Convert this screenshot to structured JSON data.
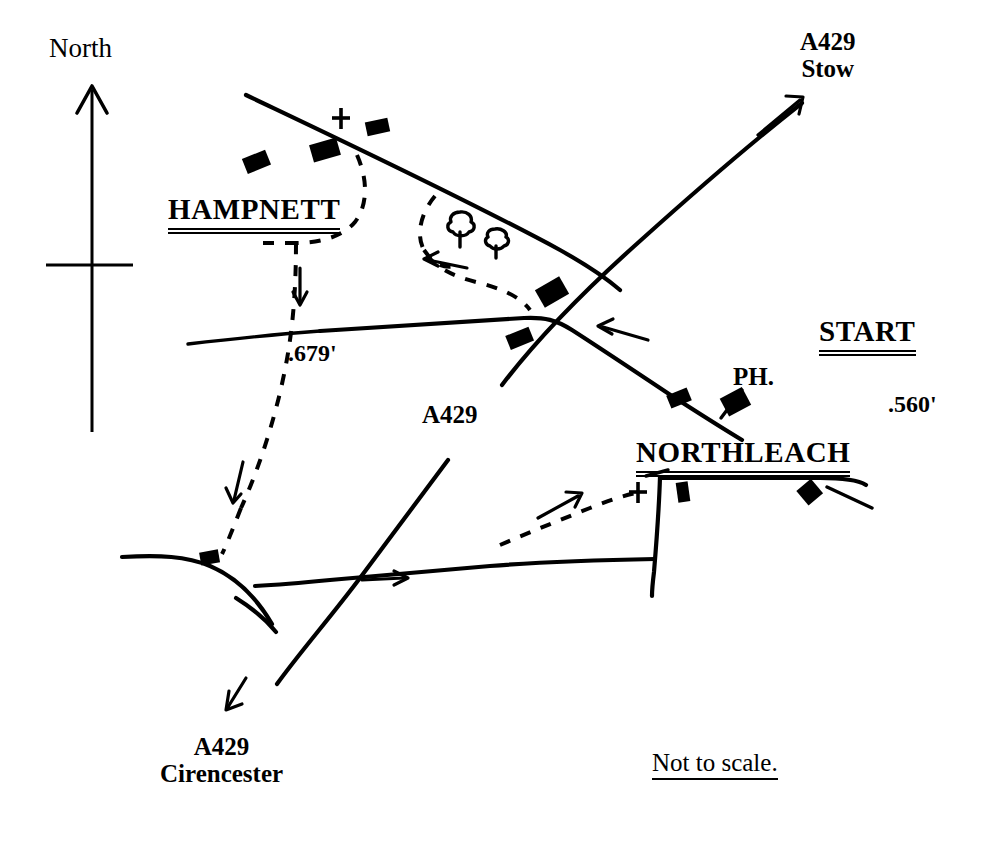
{
  "map": {
    "title": "Northleach and Hampnett route map",
    "scale_note": "Not to scale.",
    "ink_color": "#000000",
    "background_color": "#ffffff"
  },
  "compass": {
    "label": "North"
  },
  "labels": {
    "hampnett": "HAMPNETT",
    "northleach": "NORTHLEACH",
    "start": "START",
    "public_house": "PH.",
    "a429_center": "A429",
    "a429_stow_road": "A429",
    "a429_stow_place": "Stow",
    "a429_cirencester_road": "A429",
    "a429_cirencester_place": "Cirencester",
    "spot_height_hampnett": ".679'",
    "spot_height_northleach": ".560'"
  },
  "symbols": {
    "church": "church-cross-symbol",
    "tree": "tree-symbol",
    "building": "building-block",
    "footpath": "dashed-footpath",
    "direction_arrow": "direction-arrow"
  }
}
